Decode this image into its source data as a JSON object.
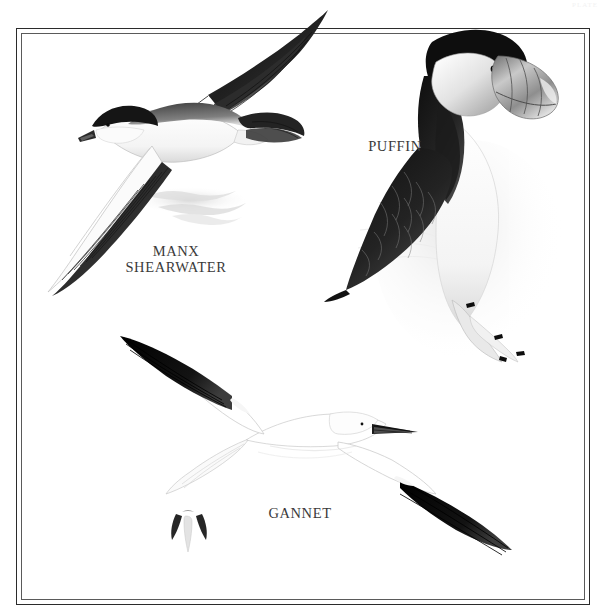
{
  "plate": {
    "kind": "field-guide-illustration-plate",
    "corner_mark": "PLATE",
    "background_color": "#ffffff",
    "frame": {
      "outer_color": "#2b2b2b",
      "inner_color": "#5a5a5a",
      "style": "double-rule"
    }
  },
  "captions": {
    "manx": "MANX\nSHEARWATER",
    "puffin": "PUFFIN",
    "gannet": "GANNET",
    "text_color": "#3a3a3a"
  },
  "birds": [
    {
      "id": "manx-shearwater",
      "common_name": "MANX SHEARWATER",
      "pose": "gliding flight, banking, upperwing and underwing both visible",
      "position": "upper-left",
      "plumage": "blackish-brown above, white below",
      "colors": {
        "dark": "#1e1e1e",
        "light": "#ffffff",
        "shade": "#b9b9b9"
      }
    },
    {
      "id": "puffin",
      "common_name": "PUFFIN",
      "pose": "standing, body in profile facing right, webbed feet forward",
      "position": "upper-right",
      "plumage": "black crown, nape and upperparts; pale grey-white face; white underparts; large deep triangular bill",
      "colors": {
        "dark": "#141414",
        "face": "#e8e8e8",
        "bill": "#9a9a9a",
        "light": "#ffffff"
      }
    },
    {
      "id": "gannet",
      "common_name": "GANNET",
      "pose": "soaring from above, wings fully spread, head to the right",
      "position": "lower-centre",
      "plumage": "white body with black outer wingtips, dagger bill",
      "colors": {
        "dark": "#0d0d0d",
        "light": "#ffffff",
        "outline": "#c9c9c9"
      }
    },
    {
      "id": "gannet-distant",
      "common_name": "GANNET",
      "pose": "small distant bird, head-on flight silhouette",
      "position": "lower-left",
      "plumage": "white with dark wingtips",
      "colors": {
        "dark": "#2a2a2a",
        "light": "#ffffff"
      }
    }
  ]
}
